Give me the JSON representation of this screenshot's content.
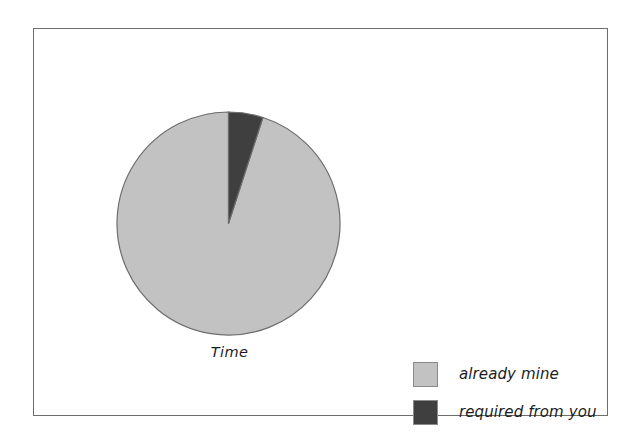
{
  "canvas": {
    "width": 636,
    "height": 445,
    "background": "#ffffff",
    "frame_color": "#6d6d6d"
  },
  "chart_data": {
    "type": "pie",
    "title": "",
    "subtitle": "",
    "xlabel": "",
    "ylabel": "",
    "grid": false,
    "center_label": "Time",
    "legend_position": "bottom-right",
    "start_angle_deg": 90,
    "direction": "counterclockwise",
    "categories": [
      "already mine",
      "required from you"
    ],
    "values": [
      95,
      5
    ],
    "units": "percent",
    "colors": [
      "#c2c2c2",
      "#3f3f3f"
    ],
    "slice_border_color": "#6d6d6d",
    "slices": [
      {
        "label": "already mine",
        "value": 95,
        "color": "#c2c2c2",
        "start_angle_deg": 90,
        "end_angle_deg": 107
      },
      {
        "label": "required from you",
        "value": 5,
        "color": "#3f3f3f",
        "start_angle_deg": 90,
        "end_angle_deg": 107
      }
    ],
    "annotations": []
  },
  "pie": {
    "caption": "Time",
    "geometry": {
      "center_x": 112.5,
      "center_y": 112.5,
      "radius": 111.5
    }
  },
  "legend": {
    "items": [
      {
        "label": "already mine",
        "color": "#c2c2c2"
      },
      {
        "label": "required from you",
        "color": "#3f3f3f"
      }
    ]
  }
}
